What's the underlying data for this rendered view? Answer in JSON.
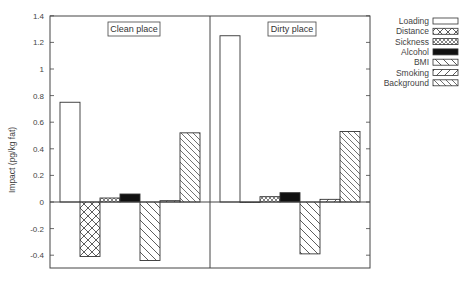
{
  "chart_data": {
    "type": "bar",
    "title": "",
    "xlabel": "",
    "ylabel": "Impact (pg/kg fat)",
    "ylim": [
      -0.48,
      1.4
    ],
    "yticks": [
      1.4,
      1.2,
      1,
      0.8,
      0.6,
      0.4,
      0.2,
      0,
      -0.2,
      -0.4
    ],
    "ytick_labels": [
      "1.4",
      "1.2",
      "1",
      "0.8",
      "0.6",
      "0.4",
      "0.2",
      "0",
      "-0.2",
      "-0.4"
    ],
    "grid": false,
    "legend_position": "right, outside",
    "panels": [
      "Clean place",
      "Dirty place"
    ],
    "categories": [
      "Loading",
      "Distance",
      "Sickness",
      "Alcohol",
      "BMI",
      "Smoking",
      "Background"
    ],
    "series": [
      {
        "name": "Clean place",
        "values": [
          0.75,
          -0.41,
          0.03,
          0.06,
          -0.44,
          0.01,
          0.52
        ]
      },
      {
        "name": "Dirty place",
        "values": [
          1.25,
          0.0,
          0.04,
          0.07,
          -0.39,
          0.02,
          0.53
        ]
      }
    ],
    "legend": [
      {
        "label": "Loading",
        "pattern": "empty"
      },
      {
        "label": "Distance",
        "pattern": "crosshatch"
      },
      {
        "label": "Sickness",
        "pattern": "dense-crosshatch"
      },
      {
        "label": "Alcohol",
        "pattern": "solid"
      },
      {
        "label": "BMI",
        "pattern": "diagonal-down"
      },
      {
        "label": "Smoking",
        "pattern": "diagonal-up"
      },
      {
        "label": "Background",
        "pattern": "diagonal-down-dense"
      }
    ]
  }
}
